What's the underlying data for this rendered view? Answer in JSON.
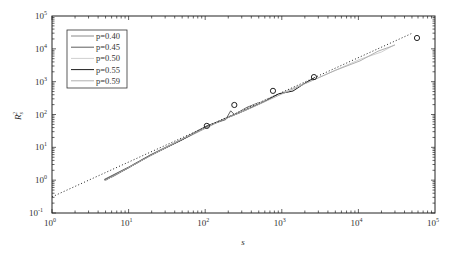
{
  "chart_data": {
    "type": "line",
    "title": "",
    "xlabel": "s",
    "ylabel": "R_s^2",
    "xscale": "log",
    "yscale": "log",
    "xlim": [
      1,
      100000
    ],
    "ylim": [
      0.1,
      100000
    ],
    "grid": false,
    "legend_position": "top-left",
    "x_ticks": [
      {
        "value": 1,
        "base": "10",
        "exp": "0"
      },
      {
        "value": 10,
        "base": "10",
        "exp": "1"
      },
      {
        "value": 100,
        "base": "10",
        "exp": "2"
      },
      {
        "value": 1000,
        "base": "10",
        "exp": "3"
      },
      {
        "value": 10000,
        "base": "10",
        "exp": "4"
      },
      {
        "value": 100000,
        "base": "10",
        "exp": "5"
      }
    ],
    "y_ticks": [
      {
        "value": 0.1,
        "base": "10",
        "exp": "-1"
      },
      {
        "value": 1,
        "base": "10",
        "exp": "0"
      },
      {
        "value": 10,
        "base": "10",
        "exp": "1"
      },
      {
        "value": 100,
        "base": "10",
        "exp": "2"
      },
      {
        "value": 1000,
        "base": "10",
        "exp": "3"
      },
      {
        "value": 10000,
        "base": "10",
        "exp": "4"
      },
      {
        "value": 100000,
        "base": "10",
        "exp": "5"
      }
    ],
    "series": [
      {
        "name": "p=0.40",
        "color": "#8a8a8a",
        "x": [
          4.8,
          10,
          19,
          50,
          105,
          200
        ],
        "y": [
          1.0,
          2.4,
          5.5,
          17,
          40,
          85
        ]
      },
      {
        "name": "p=0.45",
        "color": "#5e5e5e",
        "x": [
          4.8,
          10,
          19,
          50,
          105,
          185,
          215,
          240,
          350,
          500
        ],
        "y": [
          1.05,
          2.5,
          5.8,
          18,
          45,
          70,
          130,
          100,
          165,
          230
        ]
      },
      {
        "name": "p=0.50",
        "color": "#cfcfcf",
        "x": [
          6,
          19,
          105,
          300,
          768,
          2640,
          10500,
          20000,
          30000
        ],
        "y": [
          1.2,
          5.6,
          42,
          130,
          360,
          1150,
          4800,
          8000,
          13500
        ]
      },
      {
        "name": "p=0.55",
        "color": "#1e1e1e",
        "x": [
          5,
          10,
          19,
          50,
          105,
          300,
          600,
          900,
          1400,
          2000,
          2640
        ],
        "y": [
          1.0,
          2.4,
          5.6,
          17,
          44,
          120,
          250,
          420,
          520,
          900,
          1300
        ]
      },
      {
        "name": "p=0.59",
        "color": "#b0b0b0",
        "x": [
          5,
          19,
          105,
          400,
          1000,
          2640,
          5000,
          10500,
          18000,
          30000
        ],
        "y": [
          1.0,
          5.5,
          43,
          160,
          420,
          1150,
          2200,
          4300,
          8500,
          13000
        ]
      }
    ],
    "circles": {
      "name": "measured points",
      "x": [
        105,
        240,
        767,
        2630,
        58200
      ],
      "y": [
        45,
        195,
        525,
        1380,
        21400
      ]
    },
    "fit_line": {
      "name": "power-law fit",
      "style": "dotted",
      "prefactor": 0.31,
      "exponent": 1.06,
      "x_range": [
        1,
        50000
      ]
    }
  }
}
